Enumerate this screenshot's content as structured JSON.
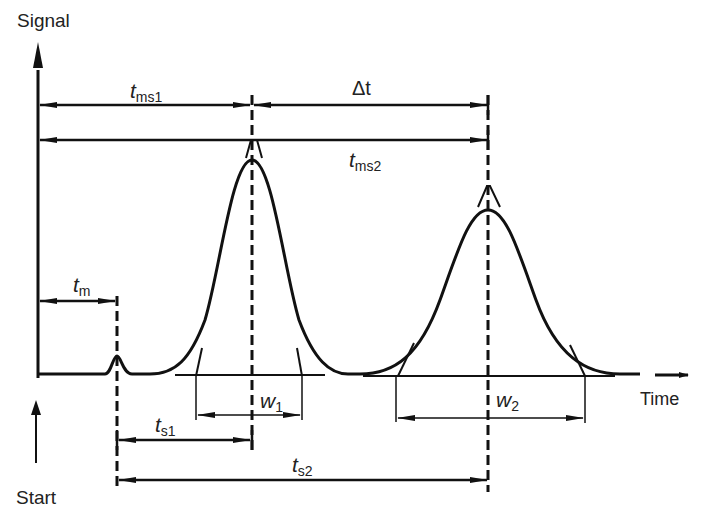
{
  "diagram": {
    "axes": {
      "y_label": "Signal",
      "x_label": "Time",
      "start_label": "Start"
    },
    "labels": {
      "tms1": {
        "main": "t",
        "sub": "ms1"
      },
      "delta_t": {
        "main": "Δt",
        "sub": ""
      },
      "tms2": {
        "main": "t",
        "sub": "ms2"
      },
      "tm": {
        "main": "t",
        "sub": "m"
      },
      "w1": {
        "main": "w",
        "sub": "1"
      },
      "w2": {
        "main": "w",
        "sub": "2"
      },
      "ts1": {
        "main": "t",
        "sub": "s1"
      },
      "ts2": {
        "main": "t",
        "sub": "s2"
      }
    },
    "peaks": [
      {
        "name": "dead-time peak",
        "x": 117,
        "height": "small"
      },
      {
        "name": "peak 1",
        "x": 252,
        "width_label": "w1"
      },
      {
        "name": "peak 2",
        "x": 488,
        "width_label": "w2"
      }
    ],
    "colors": {
      "line": "#111111",
      "text": "#222222",
      "background": "#ffffff"
    }
  }
}
